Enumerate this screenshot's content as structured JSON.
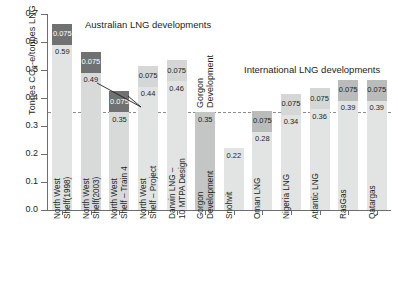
{
  "chart_data": {
    "type": "bar",
    "title": "",
    "subtitle": "",
    "xlabel": "",
    "ylabel": "Tonnes CO2-e/tonnes LNG",
    "ylim": [
      0.0,
      0.7
    ],
    "ytick_labels": [
      "0.0",
      "0.1",
      "0.2",
      "0.3",
      "0.4",
      "0.5",
      "0.6",
      "0.7"
    ],
    "ytick_values": [
      0.0,
      0.1,
      0.2,
      0.3,
      0.4,
      0.5,
      0.6,
      0.7
    ],
    "grid": false,
    "legend_position": "none",
    "stacked": true,
    "threshold_line": {
      "value": 0.35,
      "style": "dashed"
    },
    "annotations": [
      {
        "text": "Australian LNG developments",
        "kind": "group-title"
      },
      {
        "text": "International LNG developments",
        "kind": "group-title"
      }
    ],
    "categories": [
      "North West\nShelf(1998)",
      "North West\nShelf(2003)",
      "North West\nShelf – Train 4",
      "North West\nShelf – Project",
      "Darwin LNG –\n10 MTPA Design",
      "Gorgon\nDevelopment",
      "Snohvit",
      "Oman LNG",
      "Nigeria LNG",
      "Atlantic LNG",
      "RasGas",
      "Qatargas"
    ],
    "series": [
      {
        "name": "Base emissions",
        "values": [
          0.59,
          0.49,
          0.35,
          0.44,
          0.46,
          0.35,
          0.22,
          0.28,
          0.34,
          0.36,
          0.39,
          0.39
        ],
        "labels": [
          "0.59",
          "0.49",
          "0.35",
          "0.44",
          "0.46",
          "0.35",
          "0.22",
          "0.28",
          "0.34",
          "0.36",
          "0.39",
          "0.39"
        ]
      },
      {
        "name": "Additional emissions",
        "values": [
          0.075,
          0.075,
          0.075,
          0.075,
          0.075,
          0.0,
          0.0,
          0.075,
          0.075,
          0.075,
          0.075,
          0.075
        ],
        "labels": [
          "0.075",
          "0.075",
          "0.075",
          "0.075",
          "0.075",
          "",
          "",
          "0.075",
          "0.075",
          "0.075",
          "0.075",
          "0.075"
        ]
      }
    ],
    "totals": [
      0.665,
      0.565,
      0.425,
      0.515,
      0.535,
      0.35,
      0.22,
      0.355,
      0.415,
      0.435,
      0.465,
      0.465
    ]
  },
  "bars": [
    {
      "name": "north-west-shelf-1998",
      "category": "North West\nShelf(1998)",
      "base": 0.59,
      "base_label": "0.59",
      "cap": 0.075,
      "cap_label": "0.075",
      "cap_tone": "dark",
      "base_tone": "base"
    },
    {
      "name": "north-west-shelf-2003",
      "category": "North West\nShelf(2003)",
      "base": 0.49,
      "base_label": "0.49",
      "cap": 0.075,
      "cap_label": "0.075",
      "cap_tone": "dark",
      "base_tone": "base-mid"
    },
    {
      "name": "north-west-shelf-train-4",
      "category": "North West\nShelf – Train 4",
      "base": 0.35,
      "base_label": "0.35",
      "cap": 0.075,
      "cap_label": "0.075",
      "cap_tone": "dark",
      "base_tone": "base-mid"
    },
    {
      "name": "north-west-shelf-project",
      "category": "North West\nShelf – Project",
      "base": 0.44,
      "base_label": "0.44",
      "cap": 0.075,
      "cap_label": "0.075",
      "cap_tone": "light",
      "base_tone": "base"
    },
    {
      "name": "darwin-lng-10-mtpa-design",
      "category": "Darwin LNG –\n10 MTPA Design",
      "base": 0.46,
      "base_label": "0.46",
      "cap": 0.075,
      "cap_label": "0.075",
      "cap_tone": "light",
      "base_tone": "base"
    },
    {
      "name": "gorgon-development",
      "category": "Gorgon\nDevelopment",
      "base": 0.35,
      "base_label": "0.35",
      "cap": 0,
      "cap_label": "",
      "cap_tone": "none",
      "base_tone": "gorgon",
      "inbar_label": "Gorgon\nDevelopment"
    },
    {
      "name": "snohvit",
      "category": "Snohvit",
      "base": 0.22,
      "base_label": "0.22",
      "cap": 0,
      "cap_label": "",
      "cap_tone": "none",
      "base_tone": "base"
    },
    {
      "name": "oman-lng",
      "category": "Oman LNG",
      "base": 0.28,
      "base_label": "0.28",
      "cap": 0.075,
      "cap_label": "0.075",
      "cap_tone": "mid",
      "base_tone": "base"
    },
    {
      "name": "nigeria-lng",
      "category": "Nigeria LNG",
      "base": 0.34,
      "base_label": "0.34",
      "cap": 0.075,
      "cap_label": "0.075",
      "cap_tone": "light",
      "base_tone": "base"
    },
    {
      "name": "atlantic-lng",
      "category": "Atlantic LNG",
      "base": 0.36,
      "base_label": "0.36",
      "cap": 0.075,
      "cap_label": "0.075",
      "cap_tone": "light",
      "base_tone": "base"
    },
    {
      "name": "rasgas",
      "category": "RasGas",
      "base": 0.39,
      "base_label": "0.39",
      "cap": 0.075,
      "cap_label": "0.075",
      "cap_tone": "mid",
      "base_tone": "base"
    },
    {
      "name": "qatargas",
      "category": "Qatargas",
      "base": 0.39,
      "base_label": "0.39",
      "cap": 0.075,
      "cap_label": "0.075",
      "cap_tone": "mid",
      "base_tone": "base"
    }
  ],
  "labels": {
    "australian_group": "Australian LNG developments",
    "international_group": "International LNG developments",
    "y_axis_prefix": "Tonnes CO",
    "y_axis_sub": "2",
    "y_axis_suffix": "-e/tonnes LNG"
  },
  "colors": {
    "base": "#e2e4e3",
    "base_mid": "#d8dad9",
    "cap_light": "#d4d7d6",
    "cap_mid": "#b9bcbb",
    "cap_dark": "#6f7271",
    "gorgon": "#c3c6c5",
    "axis": "#6d6e71",
    "threshold": "#8a8d8f",
    "text": "#231f20"
  }
}
